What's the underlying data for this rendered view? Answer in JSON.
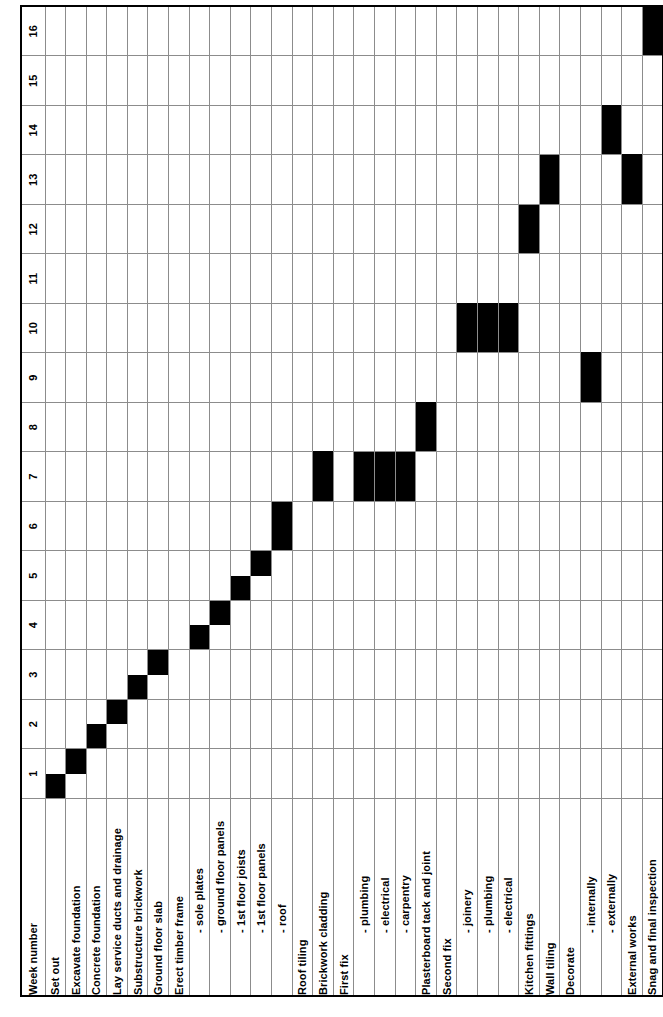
{
  "chart_data": {
    "type": "bar",
    "chart_kind": "gantt",
    "title": "",
    "xlabel": "",
    "ylabel": "",
    "week_header_label": "Week number",
    "weeks": [
      1,
      2,
      3,
      4,
      5,
      6,
      7,
      8,
      9,
      10,
      11,
      12,
      13,
      14,
      15,
      16
    ],
    "xlim": [
      1,
      16
    ],
    "grid": true,
    "legend": "none",
    "bar_color": "#000000",
    "grid_color": "#8c8c8c",
    "half_week_resolution": true,
    "categories": [
      "Set  out",
      "Excavate foundation",
      "Concrete foundation",
      "Lay service ducts and drainage",
      "Substructure brickwork",
      "Ground floor slab",
      "Erect timber frame",
      "- sole plates",
      "- ground floor panels",
      "- 1st floor joists",
      "- 1st floor panels",
      "- roof",
      "Roof tiling",
      "Brickwork cladding",
      "First fix",
      "- plumbing",
      "- electrical",
      "- carpentry",
      "Plasterboard tack and joint",
      "Second fix",
      "- joinery",
      "- plumbing",
      "- electrical",
      "Kitchen fittings",
      "Wall tiling",
      "Decorate",
      "- internally",
      "- externally",
      "External works",
      "Snag and final inspection"
    ],
    "tasks": [
      {
        "label": "Set  out",
        "indent": false,
        "start": 1.0,
        "end": 1.5
      },
      {
        "label": "Excavate foundation",
        "indent": false,
        "start": 1.5,
        "end": 2.0
      },
      {
        "label": "Concrete foundation",
        "indent": false,
        "start": 2.0,
        "end": 2.5
      },
      {
        "label": "Lay service ducts and drainage",
        "indent": false,
        "start": 2.5,
        "end": 3.0
      },
      {
        "label": "Substructure brickwork",
        "indent": false,
        "start": 3.0,
        "end": 3.5
      },
      {
        "label": "Ground floor slab",
        "indent": false,
        "start": 3.5,
        "end": 4.0
      },
      {
        "label": "Erect timber frame",
        "indent": false,
        "start": 0,
        "end": 0
      },
      {
        "label": "- sole plates",
        "indent": true,
        "start": 4.0,
        "end": 4.5
      },
      {
        "label": "- ground floor panels",
        "indent": true,
        "start": 4.5,
        "end": 5.0
      },
      {
        "label": "- 1st floor joists",
        "indent": true,
        "start": 5.0,
        "end": 5.5
      },
      {
        "label": "- 1st floor panels",
        "indent": true,
        "start": 5.5,
        "end": 6.0
      },
      {
        "label": "- roof",
        "indent": true,
        "start": 6.0,
        "end": 7.0
      },
      {
        "label": "Roof tiling",
        "indent": false,
        "start": 0,
        "end": 0
      },
      {
        "label": "Brickwork cladding",
        "indent": false,
        "start": 7.0,
        "end": 9.0
      },
      {
        "label": "First fix",
        "indent": false,
        "start": 0,
        "end": 0
      },
      {
        "label": "- plumbing",
        "indent": true,
        "start": 7.0,
        "end": 8.0
      },
      {
        "label": "- electrical",
        "indent": true,
        "start": 7.0,
        "end": 8.0
      },
      {
        "label": "- carpentry",
        "indent": true,
        "start": 7.0,
        "end": 8.0
      },
      {
        "label": "Plasterboard tack and joint",
        "indent": false,
        "start": 8.0,
        "end": 10.0
      },
      {
        "label": "Second fix",
        "indent": false,
        "start": 0,
        "end": 0
      },
      {
        "label": "- joinery",
        "indent": true,
        "start": 10.0,
        "end": 12.0
      },
      {
        "label": "- plumbing",
        "indent": true,
        "start": 10.0,
        "end": 12.0
      },
      {
        "label": "- electrical",
        "indent": true,
        "start": 10.0,
        "end": 12.0
      },
      {
        "label": "Kitchen fittings",
        "indent": false,
        "start": 12.0,
        "end": 13.0
      },
      {
        "label": "Wall tiling",
        "indent": false,
        "start": 13.0,
        "end": 14.0
      },
      {
        "label": "Decorate",
        "indent": false,
        "start": 0,
        "end": 0
      },
      {
        "label": "- internally",
        "indent": true,
        "start": 9.0,
        "end": 11.0
      },
      {
        "label": "- externally",
        "indent": true,
        "start": 14.0,
        "end": 16.0
      },
      {
        "label": "External works",
        "indent": false,
        "start": 13.0,
        "end": 15.0
      },
      {
        "label": "Snag and final inspection",
        "indent": false,
        "start": 16.0,
        "end": 17.0
      }
    ]
  }
}
